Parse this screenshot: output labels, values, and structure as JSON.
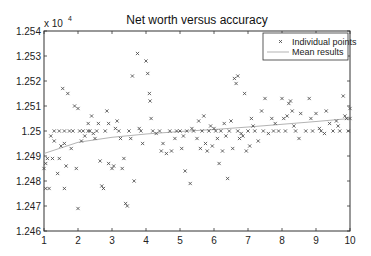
{
  "chart_data": {
    "type": "scatter",
    "title": "Net worth versus accuracy",
    "xlabel": "",
    "ylabel": "",
    "y_multiplier_label": "x 10",
    "y_multiplier_exponent": "4",
    "xlim": [
      1,
      10
    ],
    "ylim": [
      1.246,
      1.254
    ],
    "x_ticks": [
      "1",
      "2",
      "3",
      "4",
      "5",
      "6",
      "7",
      "8",
      "9",
      "10"
    ],
    "y_ticks": [
      "1.246",
      "1.247",
      "1.248",
      "1.249",
      "1.25",
      "1.251",
      "1.252",
      "1.253",
      "1.254"
    ],
    "grid": false,
    "legend_position": "upper right",
    "legend": [
      "Individual points",
      "Mean results"
    ],
    "series": [
      {
        "name": "Individual points",
        "marker": "x",
        "points": [
          [
            1.0,
            1.2485
          ],
          [
            1.05,
            1.2487
          ],
          [
            1.05,
            1.2477
          ],
          [
            1.1,
            1.2489
          ],
          [
            1.15,
            1.2477
          ],
          [
            1.2,
            1.2498
          ],
          [
            1.25,
            1.2489
          ],
          [
            1.3,
            1.25
          ],
          [
            1.3,
            1.2496
          ],
          [
            1.4,
            1.2483
          ],
          [
            1.45,
            1.2489
          ],
          [
            1.45,
            1.25
          ],
          [
            1.5,
            1.2494
          ],
          [
            1.55,
            1.2517
          ],
          [
            1.6,
            1.25
          ],
          [
            1.6,
            1.2495
          ],
          [
            1.6,
            1.2477
          ],
          [
            1.65,
            1.2486
          ],
          [
            1.7,
            1.2515
          ],
          [
            1.75,
            1.25
          ],
          [
            1.8,
            1.2493
          ],
          [
            1.85,
            1.25
          ],
          [
            1.9,
            1.251
          ],
          [
            1.95,
            1.2485
          ],
          [
            2.0,
            1.2509
          ],
          [
            2.0,
            1.2469
          ],
          [
            2.05,
            1.25
          ],
          [
            2.1,
            1.2496
          ],
          [
            2.15,
            1.25
          ],
          [
            2.2,
            1.2498
          ],
          [
            2.3,
            1.25
          ],
          [
            2.3,
            1.2503
          ],
          [
            2.35,
            1.25
          ],
          [
            2.4,
            1.2506
          ],
          [
            2.45,
            1.2499
          ],
          [
            2.5,
            1.2497
          ],
          [
            2.55,
            1.25
          ],
          [
            2.6,
            1.2503
          ],
          [
            2.65,
            1.2488
          ],
          [
            2.7,
            1.2478
          ],
          [
            2.75,
            1.2477
          ],
          [
            2.8,
            1.25
          ],
          [
            2.85,
            1.2508
          ],
          [
            2.9,
            1.2503
          ],
          [
            2.9,
            1.2487
          ],
          [
            3.0,
            1.2485
          ],
          [
            3.05,
            1.2486
          ],
          [
            3.1,
            1.2501
          ],
          [
            3.15,
            1.2504
          ],
          [
            3.2,
            1.25
          ],
          [
            3.25,
            1.2497
          ],
          [
            3.3,
            1.2485
          ],
          [
            3.35,
            1.2489
          ],
          [
            3.4,
            1.2471
          ],
          [
            3.45,
            1.247
          ],
          [
            3.5,
            1.25
          ],
          [
            3.55,
            1.2497
          ],
          [
            3.6,
            1.2522
          ],
          [
            3.65,
            1.248
          ],
          [
            3.75,
            1.2531
          ],
          [
            3.8,
            1.2501
          ],
          [
            3.85,
            1.25
          ],
          [
            3.9,
            1.2495
          ],
          [
            4.0,
            1.2528
          ],
          [
            4.05,
            1.2523
          ],
          [
            4.1,
            1.2515
          ],
          [
            4.12,
            1.2512
          ],
          [
            4.15,
            1.2505
          ],
          [
            4.2,
            1.25
          ],
          [
            4.3,
            1.2499
          ],
          [
            4.4,
            1.25
          ],
          [
            4.45,
            1.2492
          ],
          [
            4.5,
            1.2495
          ],
          [
            4.6,
            1.2491
          ],
          [
            4.7,
            1.25
          ],
          [
            4.75,
            1.2492
          ],
          [
            4.85,
            1.2497
          ],
          [
            4.9,
            1.25
          ],
          [
            5.0,
            1.25
          ],
          [
            5.05,
            1.2493
          ],
          [
            5.1,
            1.2498
          ],
          [
            5.15,
            1.2484
          ],
          [
            5.2,
            1.25
          ],
          [
            5.3,
            1.2479
          ],
          [
            5.35,
            1.2501
          ],
          [
            5.4,
            1.25
          ],
          [
            5.5,
            1.2497
          ],
          [
            5.55,
            1.2504
          ],
          [
            5.6,
            1.2493
          ],
          [
            5.65,
            1.25
          ],
          [
            5.7,
            1.2506
          ],
          [
            5.75,
            1.2495
          ],
          [
            5.8,
            1.2492
          ],
          [
            5.85,
            1.25
          ],
          [
            5.9,
            1.2502
          ],
          [
            5.95,
            1.2494
          ],
          [
            6.0,
            1.2501
          ],
          [
            6.05,
            1.25
          ],
          [
            6.1,
            1.2497
          ],
          [
            6.15,
            1.2487
          ],
          [
            6.2,
            1.25
          ],
          [
            6.25,
            1.2492
          ],
          [
            6.3,
            1.2503
          ],
          [
            6.35,
            1.2498
          ],
          [
            6.4,
            1.2481
          ],
          [
            6.45,
            1.25
          ],
          [
            6.5,
            1.2504
          ],
          [
            6.55,
            1.2493
          ],
          [
            6.6,
            1.2521
          ],
          [
            6.65,
            1.2519
          ],
          [
            6.7,
            1.2522
          ],
          [
            6.7,
            1.25
          ],
          [
            6.75,
            1.2497
          ],
          [
            6.8,
            1.2499
          ],
          [
            6.85,
            1.2498
          ],
          [
            6.9,
            1.2515
          ],
          [
            6.95,
            1.2492
          ],
          [
            7.0,
            1.25
          ],
          [
            7.05,
            1.2494
          ],
          [
            7.1,
            1.2505
          ],
          [
            7.15,
            1.2502
          ],
          [
            7.2,
            1.25
          ],
          [
            7.3,
            1.2496
          ],
          [
            7.4,
            1.2508
          ],
          [
            7.45,
            1.25
          ],
          [
            7.5,
            1.2513
          ],
          [
            7.6,
            1.2499
          ],
          [
            7.7,
            1.2505
          ],
          [
            7.75,
            1.25
          ],
          [
            7.8,
            1.2503
          ],
          [
            7.9,
            1.25
          ],
          [
            8.0,
            1.2513
          ],
          [
            8.05,
            1.2505
          ],
          [
            8.1,
            1.25
          ],
          [
            8.15,
            1.2506
          ],
          [
            8.2,
            1.2511
          ],
          [
            8.25,
            1.2512
          ],
          [
            8.3,
            1.2508
          ],
          [
            8.35,
            1.2502
          ],
          [
            8.4,
            1.25
          ],
          [
            8.5,
            1.2497
          ],
          [
            8.55,
            1.2507
          ],
          [
            8.7,
            1.25
          ],
          [
            8.8,
            1.2513
          ],
          [
            8.85,
            1.2505
          ],
          [
            8.9,
            1.25
          ],
          [
            9.0,
            1.2507
          ],
          [
            9.1,
            1.2501
          ],
          [
            9.15,
            1.25
          ],
          [
            9.25,
            1.2499
          ],
          [
            9.3,
            1.2508
          ],
          [
            9.4,
            1.2503
          ],
          [
            9.5,
            1.25
          ],
          [
            9.6,
            1.2504
          ],
          [
            9.65,
            1.2502
          ],
          [
            9.7,
            1.25
          ],
          [
            9.8,
            1.2514
          ],
          [
            9.85,
            1.2506
          ],
          [
            9.9,
            1.2505
          ],
          [
            9.95,
            1.25
          ],
          [
            10.0,
            1.2509
          ],
          [
            10.0,
            1.2505
          ]
        ]
      },
      {
        "name": "Mean results",
        "type": "line",
        "x": [
          1,
          2,
          3,
          4,
          5,
          6,
          7,
          8,
          9,
          10
        ],
        "values": [
          1.2491,
          1.24955,
          1.24975,
          1.24988,
          1.24998,
          1.25006,
          1.25016,
          1.25027,
          1.25038,
          1.2505
        ]
      }
    ]
  }
}
